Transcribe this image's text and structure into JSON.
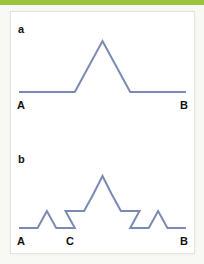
{
  "figure": {
    "background_color": "#f8f8f4",
    "card_color": "#ffffff",
    "card_border_color": "#e3e3e0",
    "accent_rule_color": "#9ac43c",
    "curve_color": "#7b8ab4",
    "label_color": "#111113"
  },
  "panels": [
    {
      "id": "a",
      "label": "a",
      "caption_labels": [
        {
          "name": "left-endpoint",
          "text": "A",
          "x": 6,
          "y": 88
        },
        {
          "name": "right-endpoint",
          "text": "B",
          "x": 169,
          "y": 88
        }
      ],
      "curve": {
        "type": "koch-curve",
        "iteration": 1,
        "segment_count": 4,
        "baseline_y": 80,
        "peak": {
          "x": 91.5,
          "y": 29
        },
        "points": [
          [
            8,
            80
          ],
          [
            63.8,
            80
          ],
          [
            91.5,
            29
          ],
          [
            119.2,
            80
          ],
          [
            175,
            80
          ]
        ]
      }
    },
    {
      "id": "b",
      "label": "b",
      "caption_labels": [
        {
          "name": "left-endpoint",
          "text": "A",
          "x": 6,
          "y": 94
        },
        {
          "name": "mid-endpoint",
          "text": "C",
          "x": 55,
          "y": 94
        },
        {
          "name": "right-endpoint",
          "text": "B",
          "x": 169,
          "y": 94
        }
      ],
      "curve": {
        "type": "koch-curve",
        "iteration": 2,
        "segment_count": 16,
        "baseline_y": 86,
        "peak": {
          "x": 91.5,
          "y": 34
        },
        "points": [
          [
            8,
            86
          ],
          [
            26.6,
            86
          ],
          [
            35.9,
            69
          ],
          [
            45.2,
            86
          ],
          [
            63.8,
            86
          ],
          [
            54.5,
            69
          ],
          [
            73.1,
            69
          ],
          [
            82.4,
            52
          ],
          [
            91.5,
            34
          ],
          [
            100.6,
            52
          ],
          [
            109.9,
            69
          ],
          [
            128.5,
            69
          ],
          [
            119.2,
            86
          ],
          [
            137.8,
            86
          ],
          [
            147.1,
            69
          ],
          [
            156.4,
            86
          ],
          [
            175,
            86
          ]
        ]
      }
    }
  ]
}
